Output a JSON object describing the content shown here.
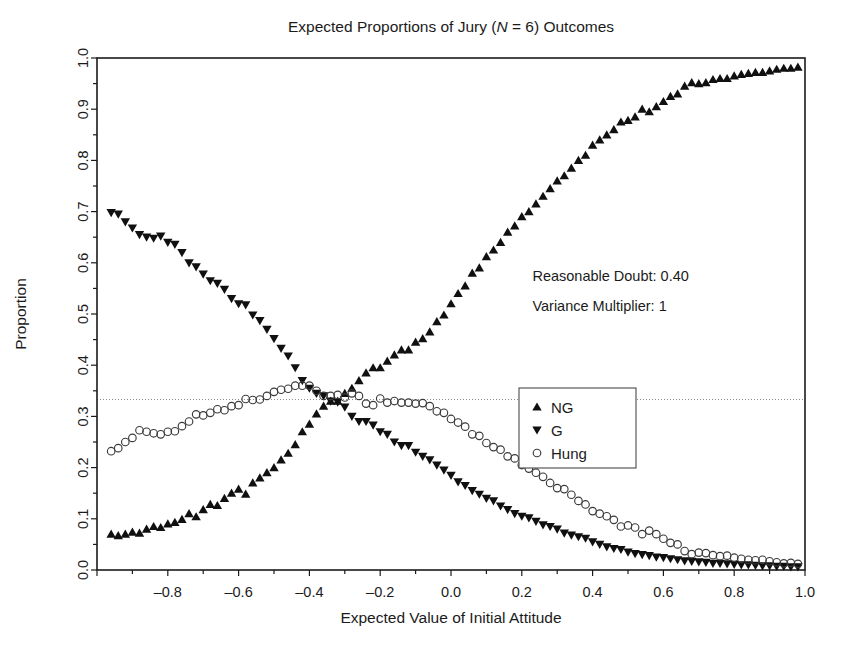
{
  "chart_data": {
    "type": "scatter",
    "title": "Expected Proportions of Jury (N = 6) Outcomes",
    "title_parts": {
      "pre": "Expected Proportions of Jury (",
      "italic": "N",
      "post": " = 6) Outcomes"
    },
    "xlabel": "Expected Value of Initial Attitude",
    "ylabel": "Proportion",
    "xlim": [
      -1.0,
      1.0
    ],
    "ylim": [
      0.0,
      1.0
    ],
    "xticks": [
      -1.0,
      -0.8,
      -0.6,
      -0.4,
      -0.2,
      0.0,
      0.2,
      0.4,
      0.6,
      0.8,
      1.0
    ],
    "xtick_labels": [
      "",
      "-0.8",
      "-0.6",
      "-0.4",
      "-0.2",
      "0.0",
      "0.2",
      "0.4",
      "0.6",
      "0.8",
      "1.0"
    ],
    "xminor_step": 0.1,
    "yticks": [
      0.0,
      0.1,
      0.2,
      0.3,
      0.4,
      0.5,
      0.6,
      0.7,
      0.8,
      0.9,
      1.0
    ],
    "ytick_labels": [
      "0.0",
      "0.1",
      "0.2",
      "0.3",
      "0.4",
      "0.5",
      "0.6",
      "0.7",
      "0.8",
      "0.9",
      "1.0"
    ],
    "grid": false,
    "reference_line": {
      "y": 0.333,
      "style": "dotted",
      "color": "#8f8f8f"
    },
    "legend": {
      "position": "center-right",
      "entries": [
        {
          "name": "NG",
          "marker": "triangle-up",
          "color": "#101010"
        },
        {
          "name": "G",
          "marker": "triangle-down",
          "color": "#101010"
        },
        {
          "name": "Hung",
          "marker": "circle-open",
          "color": "#3a3a3a"
        }
      ]
    },
    "annotations": [
      {
        "id": "reasonable-doubt",
        "text": "Reasonable Doubt: 0.40",
        "x": 0.23,
        "y": 0.565
      },
      {
        "id": "variance-multiplier",
        "text": "Variance Multiplier: 1",
        "x": 0.23,
        "y": 0.505
      }
    ],
    "x": [
      -0.96,
      -0.94,
      -0.92,
      -0.9,
      -0.88,
      -0.86,
      -0.84,
      -0.82,
      -0.8,
      -0.78,
      -0.76,
      -0.74,
      -0.72,
      -0.7,
      -0.68,
      -0.66,
      -0.64,
      -0.62,
      -0.6,
      -0.58,
      -0.56,
      -0.54,
      -0.52,
      -0.5,
      -0.48,
      -0.46,
      -0.44,
      -0.42,
      -0.4,
      -0.38,
      -0.36,
      -0.34,
      -0.32,
      -0.3,
      -0.28,
      -0.26,
      -0.24,
      -0.22,
      -0.2,
      -0.18,
      -0.16,
      -0.14,
      -0.12,
      -0.1,
      -0.08,
      -0.06,
      -0.04,
      -0.02,
      0.0,
      0.02,
      0.04,
      0.06,
      0.08,
      0.1,
      0.12,
      0.14,
      0.16,
      0.18,
      0.2,
      0.22,
      0.24,
      0.26,
      0.28,
      0.3,
      0.32,
      0.34,
      0.36,
      0.38,
      0.4,
      0.42,
      0.44,
      0.46,
      0.48,
      0.5,
      0.52,
      0.54,
      0.56,
      0.58,
      0.6,
      0.62,
      0.64,
      0.66,
      0.68,
      0.7,
      0.72,
      0.74,
      0.76,
      0.78,
      0.8,
      0.82,
      0.84,
      0.86,
      0.88,
      0.9,
      0.92,
      0.94,
      0.96,
      0.98
    ],
    "series": [
      {
        "name": "NG",
        "marker": "triangle-up",
        "values": [
          0.07,
          0.067,
          0.07,
          0.074,
          0.072,
          0.08,
          0.085,
          0.083,
          0.09,
          0.093,
          0.099,
          0.11,
          0.104,
          0.118,
          0.128,
          0.126,
          0.14,
          0.15,
          0.158,
          0.148,
          0.17,
          0.18,
          0.19,
          0.2,
          0.215,
          0.228,
          0.245,
          0.27,
          0.285,
          0.305,
          0.32,
          0.33,
          0.33,
          0.345,
          0.355,
          0.37,
          0.385,
          0.395,
          0.395,
          0.408,
          0.42,
          0.43,
          0.43,
          0.445,
          0.452,
          0.465,
          0.485,
          0.498,
          0.52,
          0.54,
          0.555,
          0.58,
          0.59,
          0.612,
          0.625,
          0.64,
          0.66,
          0.672,
          0.69,
          0.7,
          0.715,
          0.73,
          0.745,
          0.76,
          0.77,
          0.785,
          0.8,
          0.81,
          0.83,
          0.84,
          0.85,
          0.86,
          0.875,
          0.878,
          0.885,
          0.9,
          0.895,
          0.905,
          0.915,
          0.925,
          0.93,
          0.945,
          0.952,
          0.95,
          0.952,
          0.958,
          0.96,
          0.96,
          0.965,
          0.968,
          0.97,
          0.972,
          0.972,
          0.975,
          0.978,
          0.98,
          0.98,
          0.982
        ]
      },
      {
        "name": "G",
        "marker": "triangle-down",
        "values": [
          0.698,
          0.695,
          0.68,
          0.668,
          0.655,
          0.65,
          0.648,
          0.652,
          0.64,
          0.636,
          0.62,
          0.6,
          0.592,
          0.578,
          0.565,
          0.56,
          0.548,
          0.53,
          0.52,
          0.518,
          0.498,
          0.487,
          0.47,
          0.452,
          0.433,
          0.418,
          0.395,
          0.37,
          0.355,
          0.345,
          0.34,
          0.33,
          0.328,
          0.318,
          0.3,
          0.29,
          0.29,
          0.283,
          0.27,
          0.265,
          0.25,
          0.243,
          0.243,
          0.23,
          0.222,
          0.215,
          0.205,
          0.195,
          0.185,
          0.172,
          0.165,
          0.155,
          0.148,
          0.14,
          0.135,
          0.125,
          0.118,
          0.11,
          0.105,
          0.102,
          0.095,
          0.088,
          0.085,
          0.08,
          0.072,
          0.068,
          0.065,
          0.062,
          0.055,
          0.05,
          0.045,
          0.042,
          0.04,
          0.035,
          0.032,
          0.03,
          0.028,
          0.025,
          0.024,
          0.022,
          0.02,
          0.018,
          0.017,
          0.016,
          0.015,
          0.013,
          0.013,
          0.012,
          0.011,
          0.01,
          0.01,
          0.009,
          0.008,
          0.008,
          0.007,
          0.007,
          0.006,
          0.006
        ]
      },
      {
        "name": "Hung",
        "marker": "circle-open",
        "values": [
          0.232,
          0.238,
          0.25,
          0.258,
          0.273,
          0.27,
          0.267,
          0.265,
          0.27,
          0.271,
          0.281,
          0.29,
          0.304,
          0.302,
          0.307,
          0.314,
          0.312,
          0.32,
          0.322,
          0.334,
          0.332,
          0.333,
          0.34,
          0.348,
          0.352,
          0.354,
          0.36,
          0.36,
          0.36,
          0.35,
          0.34,
          0.34,
          0.342,
          0.337,
          0.345,
          0.34,
          0.325,
          0.322,
          0.335,
          0.327,
          0.33,
          0.327,
          0.327,
          0.325,
          0.326,
          0.32,
          0.31,
          0.307,
          0.295,
          0.288,
          0.28,
          0.265,
          0.262,
          0.248,
          0.24,
          0.235,
          0.222,
          0.218,
          0.205,
          0.198,
          0.19,
          0.182,
          0.17,
          0.16,
          0.158,
          0.147,
          0.135,
          0.128,
          0.115,
          0.11,
          0.105,
          0.098,
          0.085,
          0.087,
          0.083,
          0.07,
          0.077,
          0.07,
          0.061,
          0.053,
          0.05,
          0.037,
          0.031,
          0.034,
          0.033,
          0.029,
          0.027,
          0.028,
          0.024,
          0.022,
          0.02,
          0.019,
          0.02,
          0.017,
          0.015,
          0.013,
          0.014,
          0.012
        ]
      }
    ]
  },
  "caption": {
    "text": ""
  }
}
